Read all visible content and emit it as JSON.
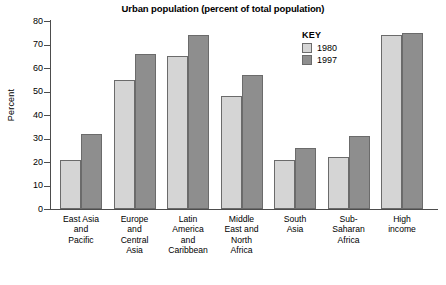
{
  "chart_data": {
    "type": "bar",
    "title": "Urban population (percent of total population)",
    "xlabel": "",
    "ylabel": "Percent",
    "ylim": [
      0,
      80
    ],
    "yticks": [
      0,
      10,
      20,
      30,
      40,
      50,
      60,
      70,
      80
    ],
    "grid": false,
    "legend_position": "upper-right-inside",
    "legend_title": "KEY",
    "categories": [
      "East Asia and Pacific",
      "Europe and Central Asia",
      "Latin America and Caribbean",
      "Middle East and North Africa",
      "South Asia",
      "Sub-Saharan Africa",
      "High income"
    ],
    "category_label_lines": [
      [
        "East Asia",
        "and",
        "Pacific"
      ],
      [
        "Europe",
        "and",
        "Central",
        "Asia"
      ],
      [
        "Latin",
        "America",
        "and",
        "Caribbean"
      ],
      [
        "Middle",
        "East and",
        "North",
        "Africa"
      ],
      [
        "South",
        "Asia"
      ],
      [
        "Sub-",
        "Saharan",
        "Africa"
      ],
      [
        "High",
        "income"
      ]
    ],
    "series": [
      {
        "name": "1980",
        "color": "#d5d5d5",
        "values": [
          21,
          55,
          65,
          48,
          21,
          22,
          74
        ]
      },
      {
        "name": "1997",
        "color": "#8e8e8e",
        "values": [
          32,
          66,
          74,
          57,
          26,
          31,
          75
        ]
      }
    ]
  },
  "axis": {
    "y_tick_labels": [
      "80",
      "70",
      "60",
      "50",
      "40",
      "30",
      "20",
      "10",
      "0"
    ]
  }
}
